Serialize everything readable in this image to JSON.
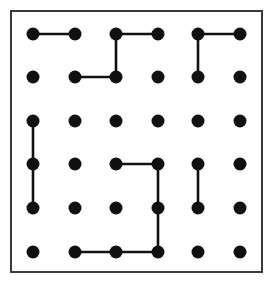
{
  "figure": {
    "background_color": "#ffffff",
    "frame": {
      "name": "outer-border",
      "x": 11,
      "y": 11,
      "width": 251,
      "height": 261,
      "stroke_color": "#3a3a3a",
      "stroke_width": 2,
      "fill": "#ffffff"
    },
    "grid": {
      "rows": 6,
      "cols": 6,
      "column_x": [
        33,
        75,
        116,
        158,
        198,
        240
      ],
      "row_y": [
        34,
        77,
        121,
        164,
        208,
        252
      ],
      "dot_radius": 6.5,
      "dot_color": "#111111"
    },
    "edges": {
      "color": "#111111",
      "width": 2.6,
      "list": [
        {
          "name": "edge-r1c1-r1c2",
          "from": [
            1,
            1
          ],
          "to": [
            1,
            2
          ],
          "orientation": "horizontal"
        },
        {
          "name": "edge-r1c3-r1c4",
          "from": [
            1,
            3
          ],
          "to": [
            1,
            4
          ],
          "orientation": "horizontal"
        },
        {
          "name": "edge-r1c5-r1c6",
          "from": [
            1,
            5
          ],
          "to": [
            1,
            6
          ],
          "orientation": "horizontal"
        },
        {
          "name": "edge-r1c3-r2c3",
          "from": [
            1,
            3
          ],
          "to": [
            2,
            3
          ],
          "orientation": "vertical"
        },
        {
          "name": "edge-r1c5-r2c5",
          "from": [
            1,
            5
          ],
          "to": [
            2,
            5
          ],
          "orientation": "vertical"
        },
        {
          "name": "edge-r2c2-r2c3",
          "from": [
            2,
            2
          ],
          "to": [
            2,
            3
          ],
          "orientation": "horizontal"
        },
        {
          "name": "edge-r3c1-r4c1",
          "from": [
            3,
            1
          ],
          "to": [
            4,
            1
          ],
          "orientation": "vertical"
        },
        {
          "name": "edge-r4c1-r5c1",
          "from": [
            4,
            1
          ],
          "to": [
            5,
            1
          ],
          "orientation": "vertical"
        },
        {
          "name": "edge-r4c3-r4c4",
          "from": [
            4,
            3
          ],
          "to": [
            4,
            4
          ],
          "orientation": "horizontal"
        },
        {
          "name": "edge-r4c4-r5c4",
          "from": [
            4,
            4
          ],
          "to": [
            5,
            4
          ],
          "orientation": "vertical"
        },
        {
          "name": "edge-r5c4-r6c4",
          "from": [
            5,
            4
          ],
          "to": [
            6,
            4
          ],
          "orientation": "vertical"
        },
        {
          "name": "edge-r4c5-r5c5",
          "from": [
            4,
            5
          ],
          "to": [
            5,
            5
          ],
          "orientation": "vertical"
        },
        {
          "name": "edge-r6c2-r6c3",
          "from": [
            6,
            2
          ],
          "to": [
            6,
            3
          ],
          "orientation": "horizontal"
        },
        {
          "name": "edge-r6c3-r6c4",
          "from": [
            6,
            3
          ],
          "to": [
            6,
            4
          ],
          "orientation": "horizontal"
        }
      ]
    },
    "dot_names": [
      [
        "dot-r1c1",
        "dot-r1c2",
        "dot-r1c3",
        "dot-r1c4",
        "dot-r1c5",
        "dot-r1c6"
      ],
      [
        "dot-r2c1",
        "dot-r2c2",
        "dot-r2c3",
        "dot-r2c4",
        "dot-r2c5",
        "dot-r2c6"
      ],
      [
        "dot-r3c1",
        "dot-r3c2",
        "dot-r3c3",
        "dot-r3c4",
        "dot-r3c5",
        "dot-r3c6"
      ],
      [
        "dot-r4c1",
        "dot-r4c2",
        "dot-r4c3",
        "dot-r4c4",
        "dot-r4c5",
        "dot-r4c6"
      ],
      [
        "dot-r5c1",
        "dot-r5c2",
        "dot-r5c3",
        "dot-r5c4",
        "dot-r5c5",
        "dot-r5c6"
      ],
      [
        "dot-r6c1",
        "dot-r6c2",
        "dot-r6c3",
        "dot-r6c4",
        "dot-r6c5",
        "dot-r6c6"
      ]
    ]
  }
}
